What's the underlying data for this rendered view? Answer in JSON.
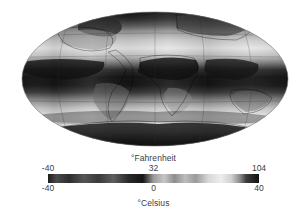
{
  "figure": {
    "type": "map-with-colorbar",
    "projection": "mollweide",
    "background_color": "#ffffff",
    "palette": "grayscale",
    "map_name": "global-surface-temperature-map"
  },
  "legend": {
    "top_title": "°Fahrenheit",
    "bottom_title": "°Celsius",
    "fahrenheit_ticks": [
      "-40",
      "32",
      "104"
    ],
    "celsius_ticks": [
      "-40",
      "0",
      "40"
    ],
    "colorbar_name": "temperature-colorbar"
  },
  "chart_data": {
    "type": "heatmap",
    "title": "",
    "subtitle": "",
    "xlabel": "",
    "ylabel": "",
    "projection": "mollweide",
    "grid": true,
    "legend_position": "bottom",
    "colorbar": {
      "label_top": "°Fahrenheit",
      "label_bottom": "°Celsius",
      "celsius_range": [
        -40,
        40
      ],
      "fahrenheit_range": [
        -40,
        104
      ],
      "celsius_ticks": [
        -40,
        0,
        40
      ],
      "fahrenheit_ticks": [
        -40,
        32,
        104
      ],
      "colormap": "grayscale-cyclic",
      "stops": [
        {
          "pos": 0.0,
          "color": "#1c1c1c"
        },
        {
          "pos": 0.04,
          "color": "#4a4a4a"
        },
        {
          "pos": 0.1,
          "color": "#2e2e2e"
        },
        {
          "pos": 0.17,
          "color": "#555555"
        },
        {
          "pos": 0.24,
          "color": "#3a3a3a"
        },
        {
          "pos": 0.31,
          "color": "#5e5e5e"
        },
        {
          "pos": 0.38,
          "color": "#2a2a2a"
        },
        {
          "pos": 0.45,
          "color": "#161616"
        },
        {
          "pos": 0.5,
          "color": "#9a9a9a"
        },
        {
          "pos": 0.55,
          "color": "#c6c6c6"
        },
        {
          "pos": 0.6,
          "color": "#8e8e8e"
        },
        {
          "pos": 0.65,
          "color": "#bdbdbd"
        },
        {
          "pos": 0.7,
          "color": "#9a9a9a"
        },
        {
          "pos": 0.76,
          "color": "#d8d8d8"
        },
        {
          "pos": 0.82,
          "color": "#ededed"
        },
        {
          "pos": 0.87,
          "color": "#cfcfcf"
        },
        {
          "pos": 0.91,
          "color": "#8a8a8a"
        },
        {
          "pos": 0.94,
          "color": "#3c3c3c"
        },
        {
          "pos": 1.0,
          "color": "#111111"
        }
      ]
    },
    "zonal_bands": [
      {
        "label": "arctic",
        "lat": 80,
        "celsius": -32,
        "shade": "#1a1a1a"
      },
      {
        "label": "subarctic",
        "lat": 65,
        "celsius": -12,
        "shade": "#4b4b4b"
      },
      {
        "label": "northern-temperate",
        "lat": 45,
        "celsius": 8,
        "shade": "#c2c2c2"
      },
      {
        "label": "northern-subtropics",
        "lat": 25,
        "celsius": 26,
        "shade": "#1e1e1e"
      },
      {
        "label": "equatorial",
        "lat": 0,
        "celsius": 27,
        "shade": "#2a2a2a"
      },
      {
        "label": "southern-subtropics",
        "lat": -25,
        "celsius": 20,
        "shade": "#a8a8a8"
      },
      {
        "label": "southern-temperate",
        "lat": -45,
        "celsius": 10,
        "shade": "#e2e2e2"
      },
      {
        "label": "subantarctic",
        "lat": -65,
        "celsius": -4,
        "shade": "#6a6a6a"
      },
      {
        "label": "antarctic",
        "lat": -80,
        "celsius": -30,
        "shade": "#1c1c1c"
      }
    ]
  }
}
